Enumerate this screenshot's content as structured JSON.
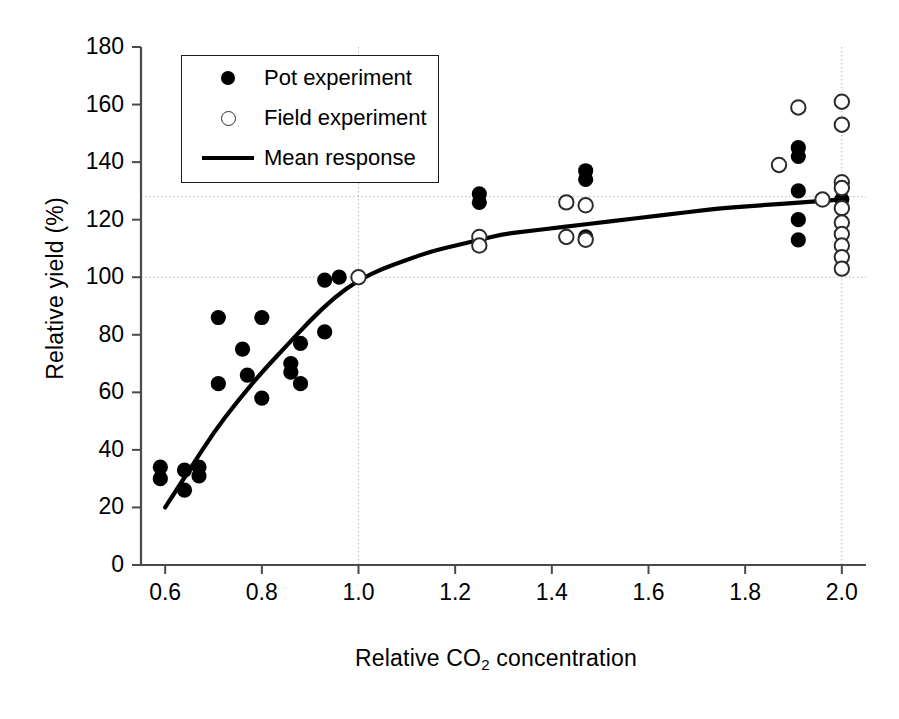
{
  "chart_data": {
    "type": "scatter",
    "title": "",
    "xlabel": "Relative CO2 concentration",
    "xlabel_parts": {
      "pre": "Relative CO",
      "sub": "2",
      "post": " concentration"
    },
    "ylabel": "Relative yield (%)",
    "xlim": [
      0.55,
      2.05
    ],
    "ylim": [
      0,
      180
    ],
    "xticks": [
      "0.6",
      "0.8",
      "1.0",
      "1.2",
      "1.4",
      "1.6",
      "1.8",
      "2.0"
    ],
    "xtick_values": [
      0.6,
      0.8,
      1.0,
      1.2,
      1.4,
      1.6,
      1.8,
      2.0
    ],
    "yticks": [
      "0",
      "20",
      "40",
      "60",
      "80",
      "100",
      "120",
      "140",
      "160",
      "180"
    ],
    "ytick_values": [
      0,
      20,
      40,
      60,
      80,
      100,
      120,
      140,
      160,
      180
    ],
    "grid": "dotted reference lines at y=100, y=128 and x=1.0, x=2.0",
    "reference_lines": {
      "horizontal": [
        100,
        128
      ],
      "vertical": [
        1.0,
        2.0
      ]
    },
    "legend_position": "upper left inside axes",
    "series": [
      {
        "name": "Pot experiment",
        "marker": "filled-circle",
        "color": "#000000",
        "points": [
          [
            0.59,
            34
          ],
          [
            0.59,
            30
          ],
          [
            0.64,
            33
          ],
          [
            0.64,
            26
          ],
          [
            0.67,
            34
          ],
          [
            0.67,
            31
          ],
          [
            0.71,
            86
          ],
          [
            0.71,
            63
          ],
          [
            0.76,
            75
          ],
          [
            0.77,
            66
          ],
          [
            0.8,
            86
          ],
          [
            0.8,
            58
          ],
          [
            0.86,
            70
          ],
          [
            0.86,
            67
          ],
          [
            0.88,
            77
          ],
          [
            0.88,
            63
          ],
          [
            0.93,
            81
          ],
          [
            0.93,
            99
          ],
          [
            0.96,
            100
          ],
          [
            1.25,
            129
          ],
          [
            1.25,
            126
          ],
          [
            1.47,
            137
          ],
          [
            1.47,
            134
          ],
          [
            1.47,
            114
          ],
          [
            1.91,
            145
          ],
          [
            1.91,
            142
          ],
          [
            1.91,
            130
          ],
          [
            1.91,
            120
          ],
          [
            1.91,
            113
          ],
          [
            2.0,
            127
          ]
        ]
      },
      {
        "name": "Field experiment",
        "marker": "open-circle",
        "color": "#2b2b2b",
        "points": [
          [
            1.0,
            100
          ],
          [
            1.25,
            114
          ],
          [
            1.25,
            111
          ],
          [
            1.43,
            126
          ],
          [
            1.43,
            114
          ],
          [
            1.47,
            125
          ],
          [
            1.47,
            113
          ],
          [
            1.87,
            139
          ],
          [
            1.91,
            159
          ],
          [
            1.96,
            127
          ],
          [
            2.0,
            161
          ],
          [
            2.0,
            153
          ],
          [
            2.0,
            133
          ],
          [
            2.0,
            131
          ],
          [
            2.0,
            124
          ],
          [
            2.0,
            119
          ],
          [
            2.0,
            115
          ],
          [
            2.0,
            111
          ],
          [
            2.0,
            107
          ],
          [
            2.0,
            103
          ]
        ]
      }
    ],
    "mean_response": {
      "name": "Mean response",
      "style": "solid-line",
      "color": "#000000",
      "points": [
        [
          0.6,
          20
        ],
        [
          0.65,
          33
        ],
        [
          0.7,
          46
        ],
        [
          0.75,
          57
        ],
        [
          0.8,
          67
        ],
        [
          0.85,
          76
        ],
        [
          0.9,
          85
        ],
        [
          0.95,
          93
        ],
        [
          1.0,
          99
        ],
        [
          1.05,
          103
        ],
        [
          1.1,
          106
        ],
        [
          1.15,
          109
        ],
        [
          1.2,
          111
        ],
        [
          1.25,
          113
        ],
        [
          1.3,
          115
        ],
        [
          1.35,
          116
        ],
        [
          1.4,
          117
        ],
        [
          1.45,
          118
        ],
        [
          1.5,
          119
        ],
        [
          1.55,
          120
        ],
        [
          1.6,
          121
        ],
        [
          1.65,
          122
        ],
        [
          1.7,
          123
        ],
        [
          1.75,
          124
        ],
        [
          1.8,
          124.6
        ],
        [
          1.85,
          125.2
        ],
        [
          1.9,
          125.8
        ],
        [
          1.95,
          126.4
        ],
        [
          2.0,
          127
        ]
      ]
    },
    "legend": [
      {
        "label": "Pot experiment",
        "marker": "filled-circle"
      },
      {
        "label": "Field experiment",
        "marker": "open-circle"
      },
      {
        "label": "Mean response",
        "marker": "line"
      }
    ]
  }
}
